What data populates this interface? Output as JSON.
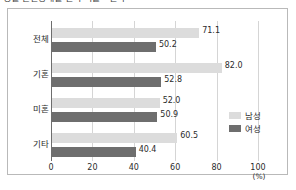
{
  "caption": "성별 혼인상태별 인식 비율 - 결과",
  "chart_data": {
    "type": "bar",
    "orientation": "horizontal",
    "title": "",
    "xlabel": "(%)",
    "ylabel": "",
    "categories": [
      "전체",
      "기혼",
      "미혼",
      "기타"
    ],
    "series": [
      {
        "name": "남성",
        "color": "#dcdcdc",
        "values": [
          71.1,
          82.0,
          52.0,
          60.5
        ]
      },
      {
        "name": "여성",
        "color": "#6e6e6e",
        "values": [
          50.2,
          52.8,
          50.9,
          40.4
        ]
      }
    ],
    "value_labels": {
      "남성": [
        "71.1",
        "82.0",
        "52.0",
        "60.5"
      ],
      "여성": [
        "50.2",
        "52.8",
        "50.9",
        "40.4"
      ]
    },
    "xlim": [
      0,
      100
    ],
    "xticks": [
      0,
      20,
      40,
      60,
      80,
      100
    ],
    "xtick_labels": [
      "0",
      "20",
      "40",
      "60",
      "80",
      "100"
    ],
    "unit_label": "(%)",
    "grid": true,
    "grid_axis": "x",
    "legend_position": "right-middle",
    "legend": [
      "남성",
      "여성"
    ]
  },
  "colors": {
    "male_bar": "#dcdcdc",
    "female_bar": "#6e6e6e",
    "gridline": "#d5d5d5",
    "axis": "#6e6e6e",
    "frame": "#b9b9b9",
    "text": "#2b2b2b"
  }
}
